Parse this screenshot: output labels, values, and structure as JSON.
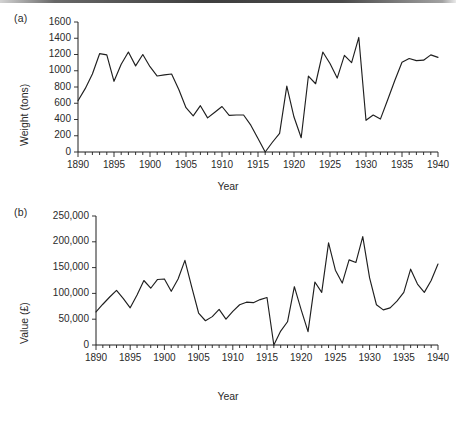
{
  "figure": {
    "panel_a_label": "(a)",
    "panel_b_label": "(b)",
    "xlabel_a": "Year",
    "xlabel_b": "Year",
    "line_color": "#1f1f1f"
  },
  "chart_data": [
    {
      "type": "line",
      "panel": "(a)",
      "title": "",
      "xlabel": "Year",
      "ylabel": "Weight (tons)",
      "xlim": [
        1890,
        1940
      ],
      "ylim": [
        0,
        1600
      ],
      "grid": false,
      "legend": "none",
      "ytick_labels": [
        "0",
        "200",
        "400",
        "600",
        "800",
        "1000",
        "1200",
        "1400",
        "1600"
      ],
      "yticks": [
        0,
        200,
        400,
        600,
        800,
        1000,
        1200,
        1400,
        1600
      ],
      "xtick_labels": [
        "1890",
        "1895",
        "1900",
        "1905",
        "1910",
        "1915",
        "1920",
        "1925",
        "1930",
        "1935",
        "1940"
      ],
      "xticks": [
        1890,
        1895,
        1900,
        1905,
        1910,
        1915,
        1920,
        1925,
        1930,
        1935,
        1940
      ],
      "minor_xtick_step": 1,
      "x": [
        1890,
        1891,
        1892,
        1893,
        1894,
        1895,
        1896,
        1897,
        1898,
        1899,
        1900,
        1901,
        1902,
        1903,
        1904,
        1905,
        1906,
        1907,
        1908,
        1909,
        1910,
        1911,
        1912,
        1913,
        1914,
        1915,
        1916,
        1917,
        1918,
        1919,
        1920,
        1921,
        1922,
        1923,
        1924,
        1925,
        1926,
        1927,
        1928,
        1929,
        1930,
        1931,
        1932,
        1933,
        1934,
        1935,
        1936,
        1937,
        1938,
        1939,
        1940
      ],
      "values": [
        630,
        780,
        960,
        1210,
        1195,
        870,
        1080,
        1230,
        1060,
        1200,
        1050,
        935,
        950,
        960,
        770,
        545,
        445,
        570,
        420,
        490,
        560,
        450,
        455,
        455,
        330,
        165,
        0,
        120,
        230,
        810,
        430,
        175,
        935,
        840,
        1230,
        1090,
        910,
        1190,
        1100,
        1410,
        390,
        455,
        405,
        640,
        880,
        1105,
        1150,
        1125,
        1130,
        1195,
        1165
      ]
    },
    {
      "type": "line",
      "panel": "(b)",
      "title": "",
      "xlabel": "Year",
      "ylabel": "Value (£)",
      "xlim": [
        1890,
        1940
      ],
      "ylim": [
        0,
        250000
      ],
      "grid": false,
      "legend": "none",
      "ytick_labels": [
        "0",
        "50,000",
        "100,000",
        "150,000",
        "200,000",
        "250,000"
      ],
      "yticks": [
        0,
        50000,
        100000,
        150000,
        200000,
        250000
      ],
      "xtick_labels": [
        "1890",
        "1895",
        "1900",
        "1905",
        "1910",
        "1915",
        "1920",
        "1925",
        "1930",
        "1935",
        "1940"
      ],
      "xticks": [
        1890,
        1895,
        1900,
        1905,
        1910,
        1915,
        1920,
        1925,
        1930,
        1935,
        1940
      ],
      "minor_xtick_step": 1,
      "x": [
        1890,
        1891,
        1892,
        1893,
        1894,
        1895,
        1896,
        1897,
        1898,
        1899,
        1900,
        1901,
        1902,
        1903,
        1904,
        1905,
        1906,
        1907,
        1908,
        1909,
        1910,
        1911,
        1912,
        1913,
        1914,
        1915,
        1916,
        1917,
        1918,
        1919,
        1920,
        1921,
        1922,
        1923,
        1924,
        1925,
        1926,
        1927,
        1928,
        1929,
        1930,
        1931,
        1932,
        1933,
        1934,
        1935,
        1936,
        1937,
        1938,
        1939,
        1940
      ],
      "values": [
        64000,
        79000,
        93000,
        106000,
        90000,
        72000,
        97000,
        125000,
        110000,
        127000,
        128000,
        104000,
        128000,
        164000,
        112000,
        62000,
        47000,
        55000,
        69000,
        50000,
        65000,
        78000,
        83000,
        82000,
        88000,
        92000,
        0,
        27000,
        45000,
        113000,
        68000,
        26000,
        122000,
        102000,
        198000,
        145000,
        120000,
        165000,
        160000,
        210000,
        130000,
        78000,
        68000,
        72000,
        85000,
        102000,
        147000,
        118000,
        102000,
        125000,
        157000
      ]
    }
  ]
}
